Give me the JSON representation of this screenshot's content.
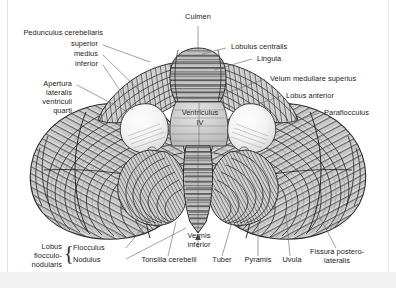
{
  "figure": {
    "background_color": "#ffffff",
    "label_color": "#1b1b1b",
    "leader_line_color": "#6e6e6e",
    "band_color": "#f1f1f1"
  },
  "labels": {
    "culmen": "Culmen",
    "pedunculus_heading": "Pedunculus cerebellaris",
    "pedunculus_superior": "superior",
    "pedunculus_medius": "medius",
    "pedunculus_inferior": "inferior",
    "apertura_l1": "Apertura",
    "apertura_l2": "lateralis",
    "apertura_l3": "ventriculi",
    "apertura_l4": "quarti",
    "lobulus_centralis": "Lobulus centralis",
    "lingula": "Lingula",
    "velum_medullare_superius": "Velum medullare superius",
    "lobus_anterior": "Lobus anterior",
    "paraflocculus": "Paraflocculus",
    "ventriculus_l1": "Ventriculus",
    "ventriculus_l2": "IV",
    "vermis_l1": "Vermis",
    "vermis_l2": "inferior",
    "lobus_floccnod_l1": "Lobus",
    "lobus_floccnod_l2": "flocculo-",
    "lobus_floccnod_l3": "nodularis",
    "flocculus": "Flocculus",
    "nodulus": "Nodulus",
    "tonsilla_cerebelli": "Tonsilla cerebelli",
    "tuber": "Tuber",
    "pyramis": "Pyramis",
    "uvula": "Uvula",
    "fissura_l1": "Fissura postero-",
    "fissura_l2": "lateralis",
    "brace_glyph": "{"
  }
}
